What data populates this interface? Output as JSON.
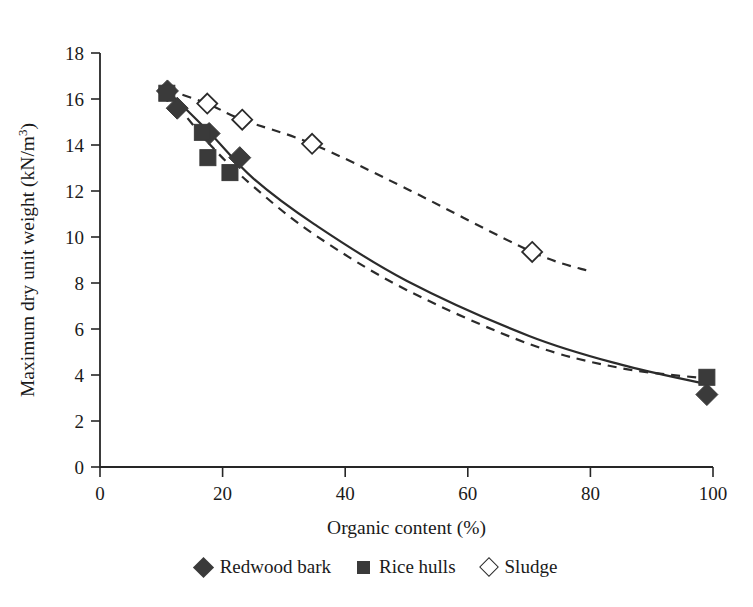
{
  "chart_data": {
    "type": "scatter",
    "title": "",
    "xlabel": "Organic content (%)",
    "ylabel": "Maximum dry unit weight (kN/m³)",
    "xlim": [
      0,
      100
    ],
    "ylim": [
      0,
      18
    ],
    "xticks": [
      0,
      20,
      40,
      60,
      80,
      100
    ],
    "yticks": [
      0,
      2,
      4,
      6,
      8,
      10,
      12,
      14,
      16,
      18
    ],
    "grid": false,
    "legend_position": "bottom-center",
    "series": [
      {
        "name": "Redwood bark",
        "marker": "filled-diamond",
        "line_style": "solid",
        "points": [
          {
            "x": 11.0,
            "y": 16.35
          },
          {
            "x": 12.6,
            "y": 15.6
          },
          {
            "x": 17.8,
            "y": 14.5
          },
          {
            "x": 22.8,
            "y": 13.45
          },
          {
            "x": 99.0,
            "y": 3.15
          }
        ],
        "trend_points": [
          {
            "x": 11.0,
            "y": 16.35
          },
          {
            "x": 18.0,
            "y": 14.5
          },
          {
            "x": 25.0,
            "y": 12.55
          },
          {
            "x": 35.0,
            "y": 10.55
          },
          {
            "x": 50.0,
            "y": 8.1
          },
          {
            "x": 70.0,
            "y": 5.7
          },
          {
            "x": 85.0,
            "y": 4.45
          },
          {
            "x": 99.0,
            "y": 3.6
          }
        ]
      },
      {
        "name": "Rice hulls",
        "marker": "filled-square",
        "line_style": "dashed",
        "points": [
          {
            "x": 10.9,
            "y": 16.25
          },
          {
            "x": 16.7,
            "y": 14.55
          },
          {
            "x": 17.6,
            "y": 13.45
          },
          {
            "x": 21.2,
            "y": 12.8
          },
          {
            "x": 99.0,
            "y": 3.9
          }
        ],
        "trend_points": [
          {
            "x": 11.0,
            "y": 16.25
          },
          {
            "x": 18.0,
            "y": 14.0
          },
          {
            "x": 25.0,
            "y": 12.2
          },
          {
            "x": 35.0,
            "y": 10.1
          },
          {
            "x": 50.0,
            "y": 7.7
          },
          {
            "x": 70.0,
            "y": 5.35
          },
          {
            "x": 85.0,
            "y": 4.3
          },
          {
            "x": 99.0,
            "y": 3.85
          }
        ]
      },
      {
        "name": "Sludge",
        "marker": "open-diamond",
        "line_style": "dashed",
        "points": [
          {
            "x": 17.5,
            "y": 15.8
          },
          {
            "x": 23.2,
            "y": 15.1
          },
          {
            "x": 34.6,
            "y": 14.05
          },
          {
            "x": 70.5,
            "y": 9.35
          }
        ],
        "trend_points": [
          {
            "x": 11.0,
            "y": 16.4
          },
          {
            "x": 17.5,
            "y": 15.8
          },
          {
            "x": 23.2,
            "y": 15.1
          },
          {
            "x": 34.6,
            "y": 14.05
          },
          {
            "x": 50.0,
            "y": 12.1
          },
          {
            "x": 70.5,
            "y": 9.35
          },
          {
            "x": 80.0,
            "y": 8.5
          }
        ]
      }
    ]
  },
  "axes": {
    "x_title": "Organic content (%)",
    "y_title_parts": {
      "main": "Maximum dry unit weight (kN/m",
      "superscript": "3",
      "tail": ")"
    },
    "x_tick_labels": [
      "0",
      "20",
      "40",
      "60",
      "80",
      "100"
    ],
    "y_tick_labels": [
      "0",
      "2",
      "4",
      "6",
      "8",
      "10",
      "12",
      "14",
      "16",
      "18"
    ]
  },
  "legend": {
    "items": [
      {
        "label": "Redwood bark",
        "marker": "filled-diamond-icon"
      },
      {
        "label": "Rice hulls",
        "marker": "filled-square-icon"
      },
      {
        "label": "Sludge",
        "marker": "open-diamond-icon"
      }
    ]
  },
  "colors": {
    "ink": "#1a1a1a",
    "axis": "#262626",
    "marker_fill": "#3a3a3a",
    "line": "#2b2b2b",
    "background": "#ffffff"
  }
}
